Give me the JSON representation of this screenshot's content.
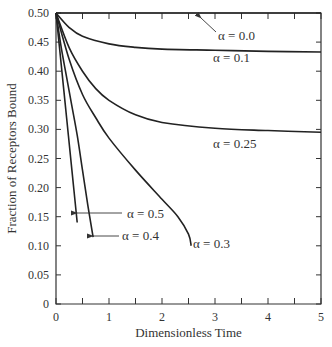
{
  "chart_data": {
    "type": "line",
    "title": "",
    "xlabel": "Dimensionless Time",
    "ylabel": "Fraction of Receptors Bound",
    "xlim": [
      0,
      5
    ],
    "ylim": [
      0,
      0.5
    ],
    "x_ticks": [
      "0",
      "1",
      "2",
      "3",
      "4",
      "5"
    ],
    "y_ticks": [
      "0",
      "0.05",
      "0.10",
      "0.15",
      "0.20",
      "0.25",
      "0.30",
      "0.35",
      "0.40",
      "0.45",
      "0.50"
    ],
    "grid": false,
    "legend": "inline labels",
    "series": [
      {
        "name": "α = 0.0",
        "x": [
          0,
          1,
          2,
          3,
          4,
          5
        ],
        "y": [
          0.5,
          0.5,
          0.5,
          0.5,
          0.5,
          0.5
        ]
      },
      {
        "name": "α = 0.1",
        "x": [
          0,
          0.25,
          0.5,
          1,
          1.5,
          2,
          3,
          4,
          5
        ],
        "y": [
          0.5,
          0.475,
          0.46,
          0.447,
          0.441,
          0.438,
          0.436,
          0.434,
          0.433
        ]
      },
      {
        "name": "α = 0.25",
        "x": [
          0,
          0.25,
          0.5,
          0.75,
          1,
          1.5,
          2,
          3,
          4,
          5
        ],
        "y": [
          0.5,
          0.44,
          0.4,
          0.37,
          0.35,
          0.325,
          0.312,
          0.302,
          0.298,
          0.295
        ]
      },
      {
        "name": "α = 0.3",
        "x": [
          0,
          0.25,
          0.5,
          0.75,
          1,
          1.5,
          2,
          2.3,
          2.5,
          2.55
        ],
        "y": [
          0.5,
          0.42,
          0.36,
          0.32,
          0.285,
          0.23,
          0.18,
          0.15,
          0.12,
          0.1
        ]
      },
      {
        "name": "α = 0.4",
        "x": [
          0,
          0.1,
          0.2,
          0.3,
          0.4,
          0.5,
          0.6,
          0.7
        ],
        "y": [
          0.5,
          0.44,
          0.39,
          0.34,
          0.29,
          0.23,
          0.17,
          0.115
        ]
      },
      {
        "name": "α = 0.5",
        "x": [
          0,
          0.1,
          0.2,
          0.3,
          0.4
        ],
        "y": [
          0.5,
          0.41,
          0.32,
          0.23,
          0.14
        ]
      }
    ],
    "annotations": [
      {
        "text": "α = 0.0",
        "arrow": true
      },
      {
        "text": "α = 0.1",
        "arrow": false
      },
      {
        "text": "α = 0.25",
        "arrow": false
      },
      {
        "text": "α = 0.5",
        "arrow": true
      },
      {
        "text": "α = 0.4",
        "arrow": true
      },
      {
        "text": "α = 0.3",
        "arrow": false
      }
    ]
  }
}
